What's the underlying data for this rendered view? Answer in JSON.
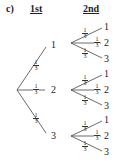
{
  "label": "c)",
  "headers": {
    "first": "1st",
    "second": "2nd"
  },
  "probability": {
    "num": "1",
    "den": "3"
  },
  "first_level": {
    "outcomes": [
      "1",
      "2",
      "3"
    ]
  },
  "second_level": [
    {
      "outcomes": [
        "1",
        "2",
        "3"
      ]
    },
    {
      "outcomes": [
        "1",
        "2",
        "3"
      ]
    },
    {
      "outcomes": [
        "1",
        "2",
        "3"
      ]
    }
  ]
}
